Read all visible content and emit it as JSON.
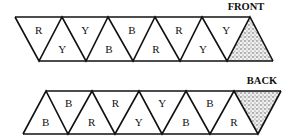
{
  "diagram": {
    "front": {
      "title": "FRONT",
      "top_y": 17,
      "bottom_y": 61,
      "top_xs": [
        15,
        62,
        108,
        155,
        202,
        250
      ],
      "bottom_xs": [
        39,
        86,
        133,
        180,
        227,
        273
      ],
      "upper_labels": [
        "R",
        "Y",
        "B",
        "R",
        "Y"
      ],
      "lower_labels": [
        "Y",
        "B",
        "R",
        "Y"
      ],
      "shaded_end": "right"
    },
    "back": {
      "title": "BACK",
      "top_y": 91,
      "bottom_y": 134,
      "top_xs": [
        46,
        92,
        139,
        186,
        234,
        281
      ],
      "bottom_xs": [
        23,
        68,
        115,
        162,
        210,
        258
      ],
      "upper_labels": [
        "B",
        "R",
        "Y",
        "B"
      ],
      "lower_labels": [
        "B",
        "R",
        "Y",
        "B",
        "R"
      ],
      "shaded_end": "right"
    },
    "colors": {
      "line": "#111111",
      "shade": "#9a9a9a",
      "background": "#ffffff"
    }
  }
}
